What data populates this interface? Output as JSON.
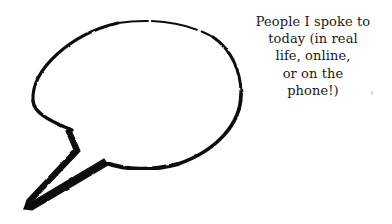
{
  "canvas": {
    "width": 392,
    "height": 224,
    "background_color": "#ffffff"
  },
  "bubble": {
    "name": "speech-bubble",
    "style": "hand-drawn ink outline, empty interior",
    "stroke_color": "#111111",
    "fill_color": "#ffffff",
    "ellipse": {
      "center_x": 136,
      "center_y": 96,
      "radius_x": 105,
      "radius_y": 76
    },
    "tail": {
      "attach_upper_x": 72,
      "attach_upper_y": 130,
      "notch_x": 78,
      "notch_y": 152,
      "tip_x": 26,
      "tip_y": 208,
      "attach_lower_x": 105,
      "attach_lower_y": 163
    }
  },
  "caption": {
    "name": "caption-text",
    "align": "center",
    "color": "#1a1a1a",
    "lines": [
      "People I spoke to",
      "today (in real",
      "life, online,",
      "or on the",
      "phone!)"
    ],
    "full_text": "People I spoke to today (in real life, online, or on the phone!)"
  }
}
